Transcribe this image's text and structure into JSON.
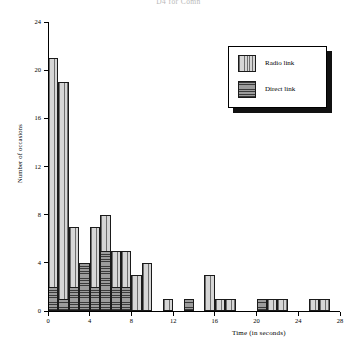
{
  "chart_data": {
    "type": "bar",
    "title": "D4 for Comn",
    "xlabel": "Time (in seconds)",
    "ylabel": "Number of occasions",
    "xlim": [
      0,
      28
    ],
    "ylim": [
      0,
      24
    ],
    "xticks": [
      0,
      4,
      8,
      12,
      16,
      20,
      24,
      28
    ],
    "yticks": [
      0,
      4,
      8,
      12,
      16,
      20,
      24
    ],
    "grid": false,
    "legend_position": "top-right",
    "bin_width": 1,
    "bin_starts": [
      0,
      1,
      2,
      3,
      4,
      5,
      6,
      7,
      8,
      9,
      10,
      11,
      12,
      13,
      14,
      15,
      16,
      17,
      18,
      19,
      20,
      21,
      22,
      23,
      24,
      25,
      26,
      27
    ],
    "series": [
      {
        "name": "Radio link",
        "pattern": "vertical-stripes",
        "color": "#c7c7c7",
        "values": [
          21,
          19,
          7,
          0,
          7,
          8,
          5,
          5,
          3,
          4,
          0,
          1,
          0,
          1,
          0,
          3,
          1,
          1,
          0,
          0,
          1,
          1,
          1,
          0,
          0,
          1,
          1,
          0
        ]
      },
      {
        "name": "Direct link",
        "pattern": "horizontal-stripes",
        "color": "#8d8d8d",
        "values": [
          2,
          1,
          2,
          4,
          2,
          5,
          2,
          2,
          0,
          0,
          0,
          0,
          0,
          1,
          0,
          0,
          0,
          0,
          0,
          0,
          1,
          0,
          0,
          0,
          0,
          0,
          0,
          0
        ]
      }
    ]
  },
  "legend": {
    "items": [
      {
        "label": "Radio link"
      },
      {
        "label": "Direct link"
      }
    ]
  }
}
